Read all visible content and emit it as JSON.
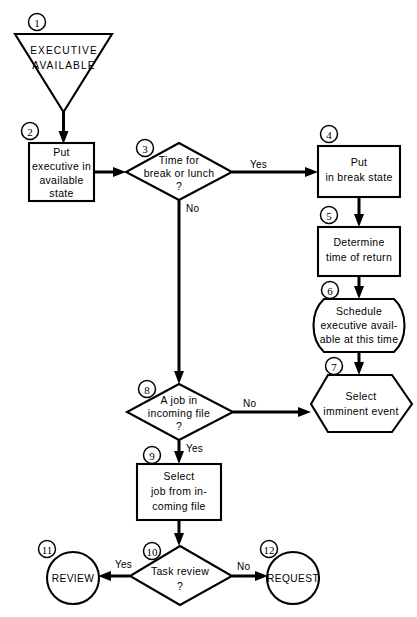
{
  "diagram": {
    "type": "flowchart",
    "canvas": {
      "width": 417,
      "height": 617
    },
    "colors": {
      "stroke": "#000000",
      "fill": "#ffffff",
      "text": "#000000"
    }
  },
  "nodes": [
    {
      "tag": "1",
      "shape": "triangle-down",
      "lines": [
        "EXECUTIVE",
        "AVAILABLE"
      ],
      "style": "terminator"
    },
    {
      "tag": "2",
      "shape": "rectangle",
      "lines": [
        "Put",
        "executive in",
        "available",
        "state"
      ],
      "style": "process"
    },
    {
      "tag": "3",
      "shape": "diamond",
      "lines": [
        "Time for",
        "break or lunch",
        "?"
      ],
      "style": "decision"
    },
    {
      "tag": "4",
      "shape": "rectangle",
      "lines": [
        "Put",
        "in break state"
      ],
      "style": "process"
    },
    {
      "tag": "5",
      "shape": "rectangle",
      "lines": [
        "Determine",
        "time of return"
      ],
      "style": "process"
    },
    {
      "tag": "6",
      "shape": "rounded-sides",
      "lines": [
        "Schedule",
        "executive avail-",
        "able at this time"
      ],
      "style": "operation"
    },
    {
      "tag": "7",
      "shape": "hexagon",
      "lines": [
        "Select",
        "imminent event"
      ],
      "style": "preparation"
    },
    {
      "tag": "8",
      "shape": "diamond",
      "lines": [
        "A job in",
        "incoming file",
        "?"
      ],
      "style": "decision"
    },
    {
      "tag": "9",
      "shape": "rectangle",
      "lines": [
        "Select",
        "job from in-",
        "coming file"
      ],
      "style": "process"
    },
    {
      "tag": "10",
      "shape": "diamond",
      "lines": [
        "Task review",
        "?"
      ],
      "style": "decision"
    },
    {
      "tag": "11",
      "shape": "circle",
      "lines": [
        "REVIEW"
      ],
      "style": "connector"
    },
    {
      "tag": "12",
      "shape": "circle",
      "lines": [
        "REQUEST"
      ],
      "style": "connector"
    }
  ],
  "edges": [
    {
      "from": "1",
      "to": "2",
      "label": ""
    },
    {
      "from": "2",
      "to": "3",
      "label": ""
    },
    {
      "from": "3",
      "to": "4",
      "label": "Yes"
    },
    {
      "from": "3",
      "to": "8",
      "label": "No"
    },
    {
      "from": "4",
      "to": "5",
      "label": ""
    },
    {
      "from": "5",
      "to": "6",
      "label": ""
    },
    {
      "from": "6",
      "to": "7",
      "label": ""
    },
    {
      "from": "8",
      "to": "7",
      "label": "No"
    },
    {
      "from": "8",
      "to": "9",
      "label": "Yes"
    },
    {
      "from": "9",
      "to": "10",
      "label": ""
    },
    {
      "from": "10",
      "to": "11",
      "label": "Yes"
    },
    {
      "from": "10",
      "to": "12",
      "label": "No"
    }
  ],
  "edge_labels": {
    "yes_3": "Yes",
    "no_3": "No",
    "no_8": "No",
    "yes_8": "Yes",
    "yes_10": "Yes",
    "no_10": "No"
  },
  "text": {
    "n1_l1": "EXECUTIVE",
    "n1_l2": "AVAILABLE",
    "n2_l1": "Put",
    "n2_l2": "executive in",
    "n2_l3": "available",
    "n2_l4": "state",
    "n3_l1": "Time for",
    "n3_l2": "break or lunch",
    "n3_l3": "?",
    "n4_l1": "Put",
    "n4_l2": "in break state",
    "n5_l1": "Determine",
    "n5_l2": "time of return",
    "n6_l1": "Schedule",
    "n6_l2": "executive avail-",
    "n6_l3": "able at this time",
    "n7_l1": "Select",
    "n7_l2": "imminent event",
    "n8_l1": "A job in",
    "n8_l2": "incoming file",
    "n8_l3": "?",
    "n9_l1": "Select",
    "n9_l2": "job from in-",
    "n9_l3": "coming file",
    "n10_l1": "Task review",
    "n10_l2": "?",
    "n11_l1": "REVIEW",
    "n12_l1": "REQUEST"
  },
  "tags": {
    "t1": "1",
    "t2": "2",
    "t3": "3",
    "t4": "4",
    "t5": "5",
    "t6": "6",
    "t7": "7",
    "t8": "8",
    "t9": "9",
    "t10": "10",
    "t11": "11",
    "t12": "12"
  }
}
